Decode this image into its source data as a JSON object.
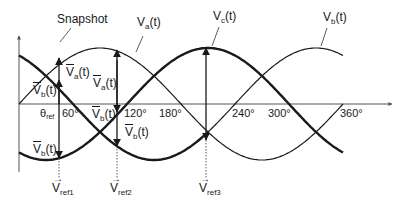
{
  "annotation": {
    "snapshot": "Snapshot"
  },
  "curves": {
    "va": {
      "name": "V",
      "sub": "a",
      "suffix": "(t)",
      "phase_deg": 0
    },
    "vb": {
      "name": "V",
      "sub": "b",
      "suffix": "(t)",
      "phase_deg": 240
    },
    "vc": {
      "name": "V",
      "sub": "c",
      "suffix": "(t)",
      "phase_deg": 120
    }
  },
  "x_axis": {
    "theta_label": "θ",
    "theta_sub": "ref",
    "ticks": [
      "60°",
      "120°",
      "180°",
      "240°",
      "300°",
      "360°"
    ]
  },
  "vector_labels": {
    "va_bar": {
      "name": "V",
      "sub": "a",
      "suffix": "(t)"
    },
    "vb_bar": {
      "name": "V",
      "sub": "b",
      "suffix": "(t)"
    }
  },
  "references": [
    {
      "name": "V",
      "sub": "ref1"
    },
    {
      "name": "V",
      "sub": "ref2"
    },
    {
      "name": "V",
      "sub": "ref3"
    }
  ],
  "colors": {
    "line": "#1a1a1a",
    "axis": "#555555"
  }
}
